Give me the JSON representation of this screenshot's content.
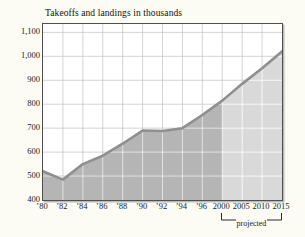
{
  "chart_data": {
    "type": "area",
    "title": "Takeoffs and landings in thousands",
    "x_tick_labels": [
      "’80",
      "’82",
      "’84",
      "’86",
      "’88",
      "’90",
      "’92",
      "’94",
      "’96",
      "2000",
      "2005",
      "2010",
      "2015"
    ],
    "x_years": [
      1980,
      1982,
      1984,
      1986,
      1988,
      1990,
      1992,
      1994,
      1996,
      2000,
      2005,
      2010,
      2015
    ],
    "values": [
      520,
      485,
      550,
      585,
      635,
      690,
      688,
      700,
      755,
      815,
      885,
      950,
      1020
    ],
    "y_ticks": [
      400,
      500,
      600,
      700,
      800,
      900,
      1000,
      1100
    ],
    "y_tick_labels": [
      "400",
      "500",
      "600",
      "700",
      "800",
      "900",
      "1,000",
      "1,100"
    ],
    "ylim": [
      400,
      1135
    ],
    "grid": true,
    "x_spacing": "even-per-tick",
    "series": [
      {
        "name": "historical",
        "index_range": [
          0,
          9
        ],
        "fill": "#b5b5b5"
      },
      {
        "name": "projected",
        "index_range": [
          9,
          12
        ],
        "fill": "#d9d9d9"
      }
    ],
    "line_color": "#8f8f8f",
    "annotations": [
      {
        "label": "projected",
        "span_ticks": [
          "2000",
          "2015"
        ]
      }
    ]
  }
}
